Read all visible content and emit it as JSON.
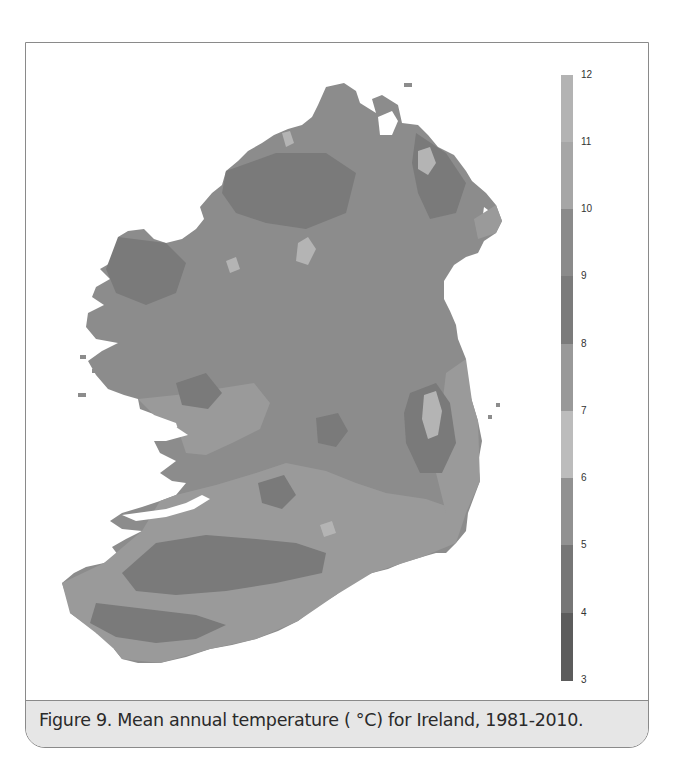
{
  "figure": {
    "caption": "Figure 9. Mean annual temperature ( °C) for Ireland, 1981-2010.",
    "map_subject": "Ireland",
    "period": "1981-2010",
    "variable": "Mean annual temperature",
    "unit": "°C"
  },
  "legend": {
    "orientation": "vertical",
    "min": 3,
    "max": 12,
    "labels": [
      "12",
      "11",
      "10",
      "9",
      "8",
      "7",
      "6",
      "5",
      "4",
      "3"
    ],
    "bands": [
      {
        "from": 11,
        "to": 12,
        "color": "#b3b3b3"
      },
      {
        "from": 10,
        "to": 11,
        "color": "#a6a6a6"
      },
      {
        "from": 9,
        "to": 10,
        "color": "#8a8a8a"
      },
      {
        "from": 8,
        "to": 9,
        "color": "#7b7b7b"
      },
      {
        "from": 7,
        "to": 8,
        "color": "#999999"
      },
      {
        "from": 6,
        "to": 7,
        "color": "#bcbcbc"
      },
      {
        "from": 5,
        "to": 6,
        "color": "#919191"
      },
      {
        "from": 4,
        "to": 5,
        "color": "#767676"
      },
      {
        "from": 3,
        "to": 4,
        "color": "#5c5c5c"
      }
    ]
  },
  "map": {
    "colors": {
      "land_base": "#8c8c8c",
      "coastal_warm": "#999999",
      "upland_cool": "#7c7c7c",
      "mountain_peaks": "#b4b4b4",
      "water": "#ffffff"
    }
  }
}
